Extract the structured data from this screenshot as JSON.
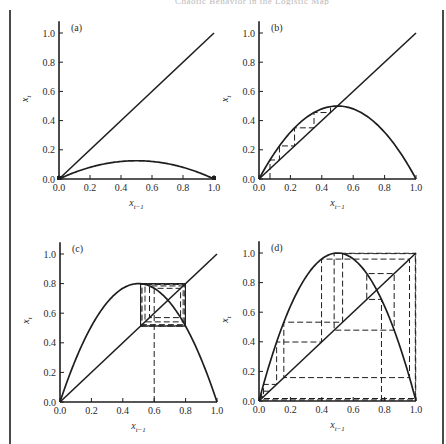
{
  "running_head": "Chaotic Behavior in the Logistic Map",
  "chart_data": [
    {
      "type": "line",
      "panel_label": "(a)",
      "description": "Logistic map x_t = r x_{t-1}(1 - x_{t-1}) with identity line; population dies out",
      "r": 0.5,
      "cobweb_x0": null,
      "cobweb_steps": 0,
      "xlabel": "x_{t-1}",
      "ylabel": "x_t",
      "xlim": [
        0,
        1.0
      ],
      "ylim": [
        0,
        1.0
      ],
      "xticks": [
        "0.0",
        "0.2",
        "0.4",
        "0.6",
        "0.8",
        "1.0"
      ],
      "yticks": [
        "0.0",
        "0.2",
        "0.4",
        "0.6",
        "0.8",
        "1.0"
      ],
      "series": [
        {
          "name": "identity x_t = x_{t-1}",
          "x": [
            0,
            1
          ],
          "y": [
            0,
            1
          ]
        },
        {
          "name": "map curve",
          "peak": {
            "x": 0.5,
            "y": 0.125
          }
        }
      ],
      "grid": false
    },
    {
      "type": "line",
      "panel_label": "(b)",
      "description": "Logistic map r = 2, cobweb converging monotonically to fixed point 0.5",
      "r": 2.0,
      "cobweb_x0": 0.07,
      "cobweb_steps": 7,
      "xlabel": "x_{t-1}",
      "ylabel": "x_t",
      "xlim": [
        0,
        1.0
      ],
      "ylim": [
        0,
        1.0
      ],
      "xticks": [
        "0.0",
        "0.2",
        "0.4",
        "0.6",
        "0.8",
        "1.0"
      ],
      "yticks": [
        "0.0",
        "0.2",
        "0.4",
        "0.6",
        "0.8",
        "1.0"
      ],
      "series": [
        {
          "name": "identity x_t = x_{t-1}",
          "x": [
            0,
            1
          ],
          "y": [
            0,
            1
          ]
        },
        {
          "name": "map curve",
          "peak": {
            "x": 0.5,
            "y": 0.5
          }
        },
        {
          "name": "cobweb trajectory",
          "values": [
            0.07,
            0.13,
            0.226,
            0.35,
            0.455,
            0.496,
            0.5
          ]
        }
      ],
      "grid": false
    },
    {
      "type": "line",
      "panel_label": "(c)",
      "description": "Logistic map r = 3.2, cobweb from 0.6 settling into a 2-cycle (~0.513, ~0.799)",
      "r": 3.2,
      "cobweb_x0": 0.6,
      "cobweb_steps": 14,
      "xlabel": "x_{t-1}",
      "ylabel": "x_t",
      "xlim": [
        0,
        1.0
      ],
      "ylim": [
        0,
        1.0
      ],
      "xticks": [
        "0.0",
        "0.2",
        "0.4",
        "0.6",
        "0.8",
        "1.0"
      ],
      "yticks": [
        "0.0",
        "0.2",
        "0.4",
        "0.6",
        "0.8",
        "1.0"
      ],
      "series": [
        {
          "name": "identity x_t = x_{t-1}",
          "x": [
            0,
            1
          ],
          "y": [
            0,
            1
          ]
        },
        {
          "name": "map curve",
          "peak": {
            "x": 0.5,
            "y": 0.8
          }
        },
        {
          "name": "cobweb trajectory",
          "values": [
            0.6,
            0.768,
            0.57,
            0.784,
            0.542,
            0.794,
            0.523,
            0.798,
            0.516,
            0.799,
            0.513
          ]
        }
      ],
      "grid": false
    },
    {
      "type": "line",
      "panel_label": "(d)",
      "description": "Logistic map r = 4, chaotic cobweb trajectory",
      "r": 4.0,
      "cobweb_x0": 0.78,
      "cobweb_steps": 14,
      "xlabel": "x_{t-1}",
      "ylabel": "x_t",
      "xlim": [
        0,
        1.0
      ],
      "ylim": [
        0,
        1.0
      ],
      "xticks": [
        "0.0",
        "0.2",
        "0.4",
        "0.6",
        "0.8",
        "1.0"
      ],
      "yticks": [
        "0.0",
        "0.2",
        "0.4",
        "0.6",
        "0.8",
        "1.0"
      ],
      "series": [
        {
          "name": "identity x_t = x_{t-1}",
          "x": [
            0,
            1
          ],
          "y": [
            0,
            1
          ]
        },
        {
          "name": "map curve",
          "peak": {
            "x": 0.5,
            "y": 1.0
          }
        },
        {
          "name": "cobweb trajectory",
          "values": [
            0.78,
            0.686,
            0.862,
            0.476,
            0.998,
            0.008,
            0.032,
            0.124,
            0.434,
            0.983,
            0.067,
            0.25,
            0.75
          ]
        }
      ],
      "grid": false
    }
  ],
  "layout": {
    "panels": [
      {
        "x0": 59,
        "x1": 214,
        "y0": 179,
        "y1": 33
      },
      {
        "x0": 259,
        "x1": 416,
        "y0": 179,
        "y1": 33
      },
      {
        "x0": 60,
        "x1": 217,
        "y0": 402,
        "y1": 254
      },
      {
        "x0": 259,
        "x1": 416,
        "y0": 401,
        "y1": 253
      }
    ]
  },
  "colors": {
    "ink": "#1e1e1e",
    "tick_text": "#2a2a2a",
    "frame": "#4a4a4a"
  }
}
